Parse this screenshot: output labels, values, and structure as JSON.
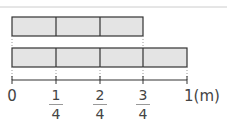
{
  "diagram": {
    "unit_label": "(m)",
    "bar_fill": "#e4e4e4",
    "line_color": "#333333",
    "bars": [
      {
        "segments": 3,
        "segment_fraction": "1/4",
        "length_fraction": "3/4"
      },
      {
        "segments": 4,
        "segment_fraction": "1/4",
        "length_fraction": "1"
      }
    ],
    "ticks": [
      {
        "label": "0"
      },
      {
        "numerator": "1",
        "denominator": "4"
      },
      {
        "numerator": "2",
        "denominator": "4"
      },
      {
        "numerator": "3",
        "denominator": "4"
      },
      {
        "label": "1"
      }
    ]
  }
}
